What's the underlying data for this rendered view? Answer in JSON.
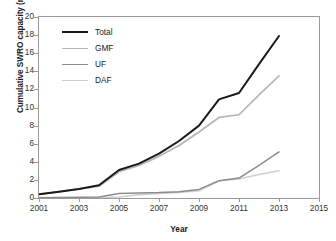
{
  "chart_data": {
    "type": "line",
    "title": "",
    "xlabel": "Year",
    "ylabel": "Cumulative SWRO capacity (million m³/d)",
    "ylabel_main": "Cumulative SWRO capacity (million m",
    "ylabel_sup": "3",
    "ylabel_tail": "/d)",
    "xlim": [
      2001,
      2015
    ],
    "ylim": [
      0,
      20
    ],
    "xticks": [
      2001,
      2003,
      2005,
      2007,
      2009,
      2011,
      2013,
      2015
    ],
    "yticks": [
      0,
      2,
      4,
      6,
      8,
      10,
      12,
      14,
      16,
      18,
      20
    ],
    "grid": false,
    "legend_position": "top-left",
    "x": [
      2001,
      2002,
      2003,
      2004,
      2005,
      2006,
      2007,
      2008,
      2009,
      2010,
      2011,
      2012,
      2013
    ],
    "series": [
      {
        "name": "Total",
        "color": "#1a1a1a",
        "width": 2.0,
        "values": [
          0.4,
          0.7,
          1.0,
          1.4,
          3.1,
          3.8,
          4.9,
          6.3,
          8.0,
          10.9,
          11.6,
          14.8,
          17.9
        ]
      },
      {
        "name": "GMF",
        "color": "#b5b5b5",
        "width": 1.7,
        "values": [
          0.4,
          0.7,
          1.0,
          1.3,
          2.9,
          3.6,
          4.6,
          5.8,
          7.3,
          8.9,
          9.2,
          11.4,
          13.5
        ]
      },
      {
        "name": "UF",
        "color": "#8c8c8c",
        "width": 1.5,
        "values": [
          0.02,
          0.05,
          0.08,
          0.12,
          0.5,
          0.55,
          0.6,
          0.7,
          0.95,
          1.9,
          2.2,
          3.6,
          5.1
        ]
      },
      {
        "name": "DAF",
        "color": "#cfcfcf",
        "width": 1.5,
        "values": [
          0.0,
          0.0,
          0.02,
          0.04,
          0.1,
          0.35,
          0.5,
          0.6,
          0.8,
          1.9,
          2.1,
          2.6,
          3.0
        ]
      }
    ]
  },
  "legend": {
    "items": [
      {
        "label": "Total"
      },
      {
        "label": "GMF"
      },
      {
        "label": "UF"
      },
      {
        "label": "DAF"
      }
    ]
  }
}
